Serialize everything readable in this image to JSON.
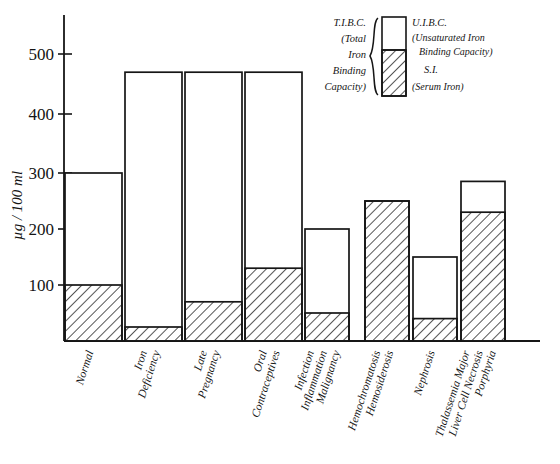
{
  "chart_data": {
    "type": "bar",
    "title": "",
    "subtitle": "",
    "xlabel": "",
    "ylabel": "µg / 100 ml",
    "ylim": [
      0,
      560
    ],
    "yticks": [
      100,
      200,
      300,
      400,
      500
    ],
    "ytick_labels": [
      "100",
      "200",
      "300",
      "400",
      "500"
    ],
    "grid": false,
    "stacked": true,
    "legend_position": "top-right",
    "categories": [
      "Normal",
      "Iron Deficiency",
      "Late Pregnancy",
      "Oral Contraceptives",
      "Infection Inflammation Malignancy",
      "Hemochromatosis Hemosiderosis",
      "Nephrosis",
      "Thalassemia Major Liver Cell Necrosis Porphyria"
    ],
    "category_lines": [
      [
        "Normal"
      ],
      [
        "Iron",
        "Deficiency"
      ],
      [
        "Late",
        "Pregnancy"
      ],
      [
        "Oral",
        "Contraceptives"
      ],
      [
        "Infection",
        "Inflammation",
        "Malignancy"
      ],
      [
        "Hemochromatosis",
        "Hemosiderosis"
      ],
      [
        "Nephrosis"
      ],
      [
        "Thalassemia Major",
        "Liver Cell Necrosis",
        "Porphyria"
      ]
    ],
    "series": [
      {
        "name": "S.I. (Serum Iron)",
        "fill": "hatched",
        "values": [
          100,
          25,
          70,
          130,
          50,
          250,
          40,
          230
        ]
      },
      {
        "name": "U.I.B.C. (Unsaturated Iron Binding Capacity)",
        "fill": "open",
        "values": [
          200,
          455,
          410,
          350,
          150,
          0,
          110,
          55
        ]
      }
    ],
    "totals_tibc": [
      300,
      480,
      480,
      480,
      200,
      250,
      150,
      285
    ],
    "units": "µg / 100 ml"
  },
  "legend": {
    "left_label_lines": [
      "T.I.B.C.",
      "(Total",
      "Iron",
      "Binding",
      "Capacity)"
    ],
    "right_top_label": "U.I.B.C.",
    "right_top_sub_lines": [
      "(Unsaturated Iron",
      "Binding Capacity)"
    ],
    "right_bottom_label": "S.I.",
    "right_bottom_sub": "(Serum Iron)"
  },
  "colors": {
    "ink": "#161616",
    "paper": "#ffffff",
    "hatch": "#2a2a2a"
  }
}
